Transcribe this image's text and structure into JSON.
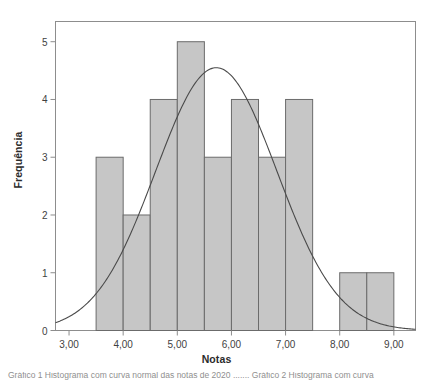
{
  "figure": {
    "top_cut_text": "",
    "caption_cut_text": "Gráfico 1 Histograma com curva normal das notas de 2020 ....... Gráfico 2 Histograma com curva"
  },
  "chart_data": {
    "type": "bar",
    "title": "",
    "xlabel": "Notas",
    "ylabel": "Frequência",
    "xlim": [
      2.75,
      9.4
    ],
    "ylim": [
      0,
      5.35
    ],
    "grid": false,
    "legend": null,
    "bin_width": 0.5,
    "bar_fill": "#c6c6c6",
    "bar_stroke": "#6b6b6b",
    "curve_stroke": "#4a4a4a",
    "frame_stroke": "#8d8d8d",
    "bins": [
      {
        "start": 3.5,
        "end": 4.0,
        "value": 3
      },
      {
        "start": 4.0,
        "end": 4.5,
        "value": 2
      },
      {
        "start": 4.5,
        "end": 5.0,
        "value": 4
      },
      {
        "start": 5.0,
        "end": 5.5,
        "value": 5
      },
      {
        "start": 5.5,
        "end": 6.0,
        "value": 3
      },
      {
        "start": 6.0,
        "end": 6.5,
        "value": 4
      },
      {
        "start": 6.5,
        "end": 7.0,
        "value": 3
      },
      {
        "start": 7.0,
        "end": 7.5,
        "value": 4
      },
      {
        "start": 7.5,
        "end": 8.0,
        "value": 0
      },
      {
        "start": 8.0,
        "end": 8.5,
        "value": 1
      },
      {
        "start": 8.5,
        "end": 9.0,
        "value": 1
      }
    ],
    "categories": [
      "3,50-4,00",
      "4,00-4,50",
      "4,50-5,00",
      "5,00-5,50",
      "5,50-6,00",
      "6,00-6,50",
      "6,50-7,00",
      "7,00-7,50",
      "7,50-8,00",
      "8,00-8,50",
      "8,50-9,00"
    ],
    "values": [
      3,
      2,
      4,
      5,
      3,
      4,
      3,
      4,
      0,
      1,
      1
    ],
    "normal_curve": {
      "mean": 5.72,
      "std": 1.12,
      "peak_value": 4.55,
      "n": 30,
      "description": "normal distribution overlay curve"
    },
    "xticks": [
      {
        "value": 3.0,
        "label": "3,00"
      },
      {
        "value": 4.0,
        "label": "4,00"
      },
      {
        "value": 5.0,
        "label": "5,00"
      },
      {
        "value": 6.0,
        "label": "6,00"
      },
      {
        "value": 7.0,
        "label": "7,00"
      },
      {
        "value": 8.0,
        "label": "8,00"
      },
      {
        "value": 9.0,
        "label": "9,00"
      }
    ],
    "yticks": [
      {
        "value": 0,
        "label": "0"
      },
      {
        "value": 1,
        "label": "1"
      },
      {
        "value": 2,
        "label": "2"
      },
      {
        "value": 3,
        "label": "3"
      },
      {
        "value": 4,
        "label": "4"
      },
      {
        "value": 5,
        "label": "5"
      }
    ]
  }
}
